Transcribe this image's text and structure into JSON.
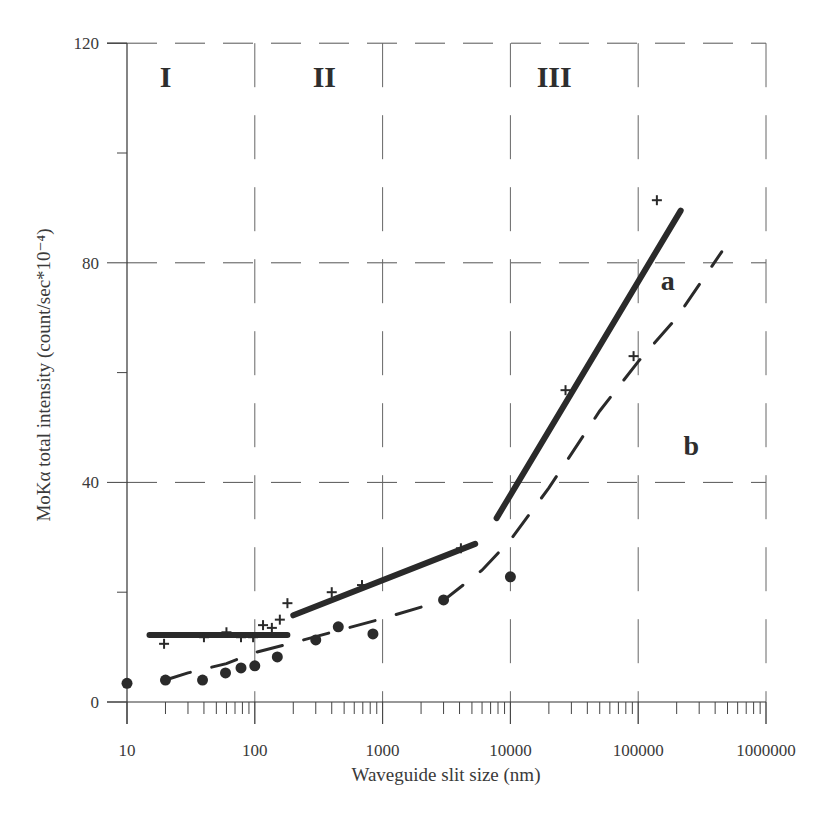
{
  "chart_data": {
    "type": "scatter",
    "title": "",
    "xlabel": "Waveguide slit size (nm)",
    "ylabel": "MoKα total intensity (count/sec*10⁻⁴)",
    "xscale": "log",
    "xlim": [
      10,
      1000000
    ],
    "ylim": [
      0,
      120
    ],
    "x_ticks": [
      "10",
      "100",
      "1000",
      "10000",
      "100000",
      "1000000"
    ],
    "y_ticks": [
      "0",
      "40",
      "80",
      "120"
    ],
    "grid": true,
    "regions": [
      {
        "label": "I",
        "x_range": [
          10,
          100
        ]
      },
      {
        "label": "II",
        "x_range": [
          100,
          1000
        ]
      },
      {
        "label": "III",
        "x_range": [
          1000,
          10000
        ]
      }
    ],
    "series": [
      {
        "name": "a",
        "marker": "cross",
        "points": [
          [
            19.5,
            10.6
          ],
          [
            40,
            11.8
          ],
          [
            60,
            12.7
          ],
          [
            78,
            11.8
          ],
          [
            97,
            11.8
          ],
          [
            116,
            14.0
          ],
          [
            136,
            13.5
          ],
          [
            157,
            15.0
          ],
          [
            180,
            18.0
          ],
          [
            400,
            20.0
          ],
          [
            690,
            21.3
          ],
          [
            4100,
            28.0
          ],
          [
            27000,
            56.8
          ],
          [
            92000,
            63.0
          ],
          [
            140000,
            91.4
          ]
        ],
        "fit_segments": [
          {
            "style": "solid",
            "points": [
              [
                15,
                12.2
              ],
              [
                180,
                12.2
              ]
            ]
          },
          {
            "style": "solid",
            "points": [
              [
                200,
                15.8
              ],
              [
                5300,
                28.8
              ]
            ]
          },
          {
            "style": "solid",
            "points": [
              [
                7800,
                33.5
              ],
              [
                215000,
                89.5
              ]
            ]
          }
        ]
      },
      {
        "name": "b",
        "marker": "circle",
        "points": [
          [
            10,
            3.4
          ],
          [
            20,
            4.0
          ],
          [
            39,
            4.0
          ],
          [
            59,
            5.3
          ],
          [
            78,
            6.2
          ],
          [
            100,
            6.6
          ],
          [
            150,
            8.2
          ],
          [
            300,
            11.3
          ],
          [
            450,
            13.7
          ],
          [
            840,
            12.4
          ],
          [
            3000,
            18.6
          ],
          [
            10000,
            22.8
          ]
        ],
        "fit_segments": [
          {
            "style": "dashed",
            "points": [
              [
                20,
                4.0
              ],
              [
                30,
                5.3
              ],
              [
                60,
                7.0
              ],
              [
                100,
                9.0
              ],
              [
                200,
                10.8
              ],
              [
                500,
                13.3
              ],
              [
                1000,
                15.2
              ],
              [
                3000,
                18.5
              ],
              [
                6000,
                24.0
              ],
              [
                10000,
                29.5
              ],
              [
                20000,
                39.0
              ],
              [
                50000,
                53.0
              ],
              [
                100000,
                62.0
              ],
              [
                200000,
                70.0
              ],
              [
                450000,
                82.0
              ]
            ]
          }
        ]
      }
    ],
    "annotations": [
      {
        "text": "I",
        "x": 20,
        "y": 112
      },
      {
        "text": "II",
        "x": 350,
        "y": 112
      },
      {
        "text": "III",
        "x": 22000,
        "y": 112
      },
      {
        "text": "a",
        "x": 170000,
        "y": 75
      },
      {
        "text": "b",
        "x": 260000,
        "y": 45
      }
    ]
  }
}
